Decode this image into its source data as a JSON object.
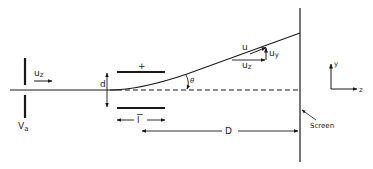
{
  "figure": {
    "colors": {
      "ink": "#1a1a1a",
      "background": "#ffffff"
    },
    "labels": {
      "accelerating_voltage": "V",
      "accelerating_voltage_sub": "a",
      "initial_velocity": "u",
      "initial_velocity_sub": "z",
      "plate_top_sign": "+",
      "plate_bottom_sign": "−",
      "plate_separation": "d",
      "plate_length": "l",
      "deflection_angle": "θ",
      "velocity": "u",
      "velocity_y": "u",
      "velocity_y_sub": "y",
      "velocity_z": "u",
      "velocity_z_sub": "z",
      "distance_to_screen": "D",
      "screen": "Screen",
      "axis_y": "y",
      "axis_z": "z"
    }
  }
}
